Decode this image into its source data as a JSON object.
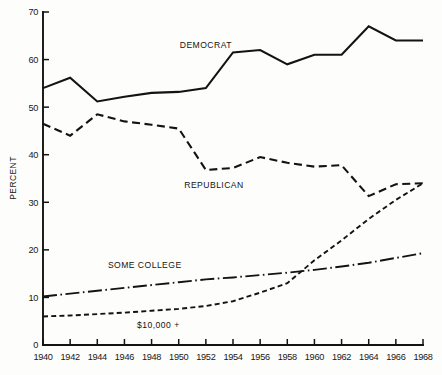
{
  "chart_data": {
    "type": "line",
    "title": "",
    "xlabel": "",
    "ylabel": "PERCENT",
    "xlim": [
      1940,
      1968
    ],
    "ylim": [
      0,
      70
    ],
    "grid": false,
    "legend_position": "inline-annotations",
    "x": [
      1940,
      1942,
      1944,
      1946,
      1948,
      1950,
      1952,
      1954,
      1956,
      1958,
      1960,
      1962,
      1964,
      1966,
      1968
    ],
    "xtick_labels": [
      "1940",
      "1942",
      "1944",
      "1946",
      "1948",
      "1950",
      "1952",
      "1954",
      "1956",
      "1958",
      "1960",
      "1962",
      "1964",
      "1966",
      "1968"
    ],
    "ytick_labels": [
      "0",
      "10",
      "20",
      "30",
      "40",
      "50",
      "60",
      "70"
    ],
    "ytick_values": [
      0,
      10,
      20,
      30,
      40,
      50,
      60,
      70
    ],
    "series": [
      {
        "name": "DEMOCRAT",
        "style": "solid",
        "label_x": 1952,
        "label_y": 62.5,
        "values": [
          54.0,
          56.2,
          51.2,
          52.2,
          53.0,
          53.2,
          54.0,
          61.5,
          62.0,
          59.0,
          61.0,
          61.0,
          67.0,
          64.0,
          64.0
        ]
      },
      {
        "name": "REPUBLICAN",
        "style": "dashed",
        "label_x": 1952.6,
        "label_y": 33.0,
        "values": [
          46.5,
          44.0,
          48.5,
          47.0,
          46.3,
          45.5,
          36.8,
          37.2,
          39.5,
          38.3,
          37.5,
          37.8,
          31.3,
          33.8,
          34.0
        ]
      },
      {
        "name": "SOME COLLEGE",
        "style": "dash-dot",
        "label_x": 1947.5,
        "label_y": 16.2,
        "values": [
          10.2,
          10.8,
          11.4,
          12.0,
          12.6,
          13.2,
          13.8,
          14.2,
          14.7,
          15.2,
          15.8,
          16.5,
          17.3,
          18.3,
          19.3
        ]
      },
      {
        "name": "$10,000 +",
        "style": "fine-dashed",
        "label_x": 1948.5,
        "label_y": 3.6,
        "values": [
          6.0,
          6.2,
          6.5,
          6.8,
          7.2,
          7.6,
          8.2,
          9.2,
          11.0,
          13.0,
          17.8,
          22.0,
          26.5,
          30.5,
          34.0
        ]
      }
    ]
  },
  "axis": {
    "y_title": "PERCENT"
  }
}
